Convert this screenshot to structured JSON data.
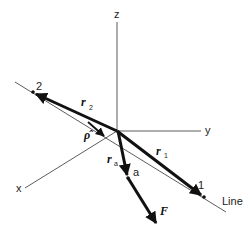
{
  "diagram": {
    "axes": {
      "z_label": "z",
      "y_label": "y",
      "x_label": "x"
    },
    "line_label": "Line",
    "points": {
      "p1_label": "1",
      "p2_label": "2",
      "pa_label": "a"
    },
    "vectors": {
      "r1": {
        "symbol": "r",
        "subscript": "1"
      },
      "r2": {
        "symbol": "r",
        "subscript": "2"
      },
      "ra": {
        "symbol": "r",
        "subscript": "a"
      },
      "rho_hat": {
        "symbol": "ρ̂"
      },
      "F": {
        "symbol": "F"
      }
    },
    "colors": {
      "stroke": "#1a1a1a",
      "background": "#ffffff"
    }
  }
}
